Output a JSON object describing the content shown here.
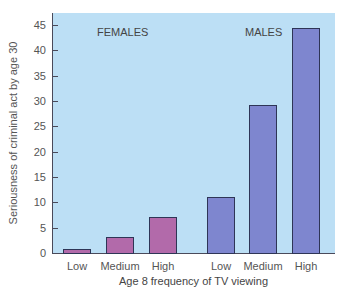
{
  "chart_data": {
    "type": "bar",
    "title": "",
    "xlabel": "Age 8 frequency of TV viewing",
    "ylabel": "Seriousness of criminal act by age 30",
    "ylim": [
      0,
      45
    ],
    "yticks": [
      0,
      5,
      10,
      15,
      20,
      25,
      30,
      35,
      40,
      45
    ],
    "categories": [
      "Low",
      "Medium",
      "High"
    ],
    "series": [
      {
        "name": "FEMALES",
        "color": "#b26aaa",
        "values": [
          0.8,
          3.2,
          7.1
        ]
      },
      {
        "name": "MALES",
        "color": "#7e86cf",
        "values": [
          11.1,
          29.3,
          44.5
        ]
      }
    ],
    "background": "#bcdff5",
    "grid": false
  },
  "labels": {
    "females": "FEMALES",
    "males": "MALES",
    "xlabel": "Age 8 frequency of TV viewing",
    "ylabel": "Seriousness of criminal act by age 30",
    "cats": [
      "Low",
      "Medium",
      "High"
    ]
  }
}
